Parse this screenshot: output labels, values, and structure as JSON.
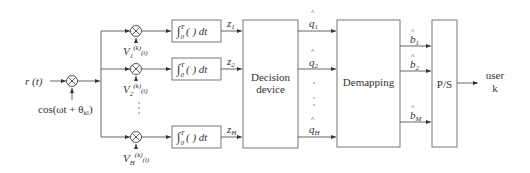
{
  "diagram": {
    "type": "block-diagram",
    "input": {
      "label": "r (t)"
    },
    "carrier": {
      "label": "cos(ωt + θ",
      "subscript": "kl",
      "suffix": ")"
    },
    "branch_codes": [
      {
        "base": "V",
        "sub": "1",
        "sup": "(k)",
        "arg": "(t)"
      },
      {
        "base": "V",
        "sub": "2",
        "sup": "(k)",
        "arg": "(t)"
      },
      {
        "base": "V",
        "sub": "H",
        "sup": "(k)",
        "arg": "(t)"
      }
    ],
    "integrators": [
      {
        "label": "∫",
        "upper": "T",
        "lower": "0",
        "body": "( ) dt"
      },
      {
        "label": "∫",
        "upper": "T",
        "lower": "0",
        "body": "( ) dt"
      },
      {
        "label": "∫",
        "upper": "T",
        "lower": "0",
        "body": "( ) dt"
      }
    ],
    "z_outputs": [
      {
        "base": "z",
        "sub": "1"
      },
      {
        "base": "z",
        "sub": "2"
      },
      {
        "base": "z",
        "sub": "H"
      }
    ],
    "decision_device": {
      "line1": "Decision",
      "line2": "device"
    },
    "q_outputs": [
      {
        "hat": "^",
        "base": "q",
        "sub": "1"
      },
      {
        "hat": "^",
        "base": "q",
        "sub": "2"
      },
      {
        "hat": "^",
        "base": "q",
        "sub": "H"
      }
    ],
    "demapping": {
      "label": "Demapping"
    },
    "b_outputs": [
      {
        "hat": "^",
        "base": "b",
        "sub": "1"
      },
      {
        "hat": "^",
        "base": "b",
        "sub": "2"
      },
      {
        "hat": "^",
        "base": "b",
        "sub": "M"
      }
    ],
    "ps": {
      "label": "P/S"
    },
    "output": {
      "line1": "user",
      "line2": "k"
    },
    "ellipsis": "·"
  }
}
